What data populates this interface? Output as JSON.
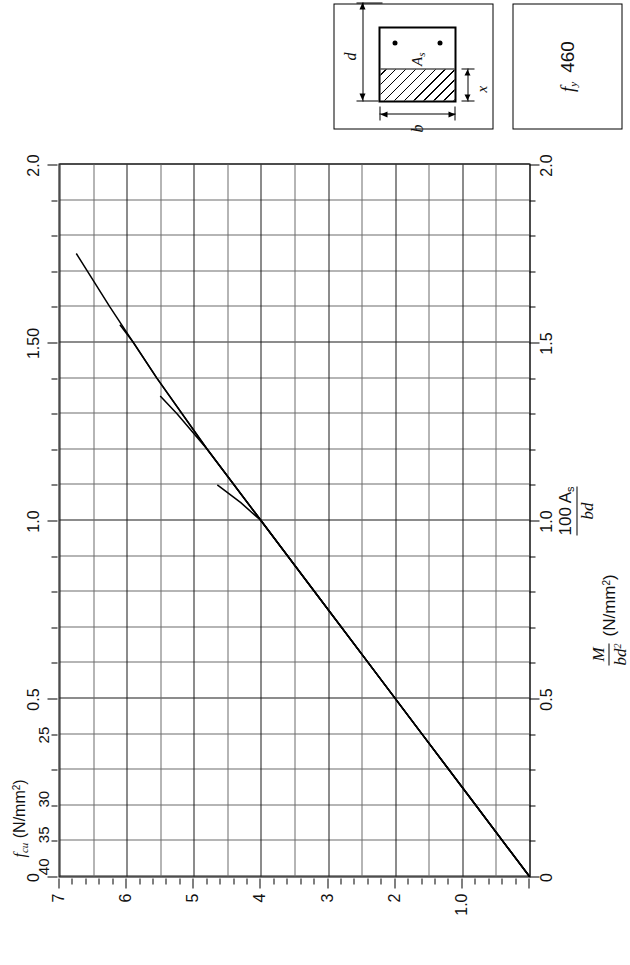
{
  "figure": {
    "fy_box": {
      "symbol": "f",
      "symbol_sub": "y",
      "value": "460"
    },
    "beam_diagram": {
      "label_d": "d",
      "label_b": "b",
      "label_x": "x",
      "label_as": "A",
      "label_as_sub": "s"
    },
    "fcu_legend": {
      "title": "f",
      "title_sub": "cu",
      "title_units": "(N/mm",
      "title_units_sup": "2",
      "title_units_end": ")"
    }
  },
  "chart_data": {
    "type": "line",
    "title": "",
    "xlabel_num": "100 A",
    "xlabel_num_sub": "s",
    "xlabel_den": "bd",
    "ylabel_num": "M",
    "ylabel_den": "bd",
    "ylabel_den_sup": "2",
    "ylabel_units": "(N/mm",
    "ylabel_units_sup": "2",
    "ylabel_units_end": ")",
    "xlim": [
      0,
      2.0
    ],
    "ylim": [
      0,
      7
    ],
    "grid": true,
    "legend_position": "top-left",
    "x_ticks_major": [
      0,
      0.5,
      1.0,
      1.5,
      2.0
    ],
    "x_ticklabels_bottom": [
      "0",
      "0.5",
      "1.0",
      "1.5",
      "2.0"
    ],
    "x_ticklabels_top": [
      "0",
      "0.5",
      "1.0",
      "1.50",
      "2.0"
    ],
    "x_ticks_minor_step": 0.1,
    "y_ticks_major": [
      1,
      2,
      3,
      4,
      5,
      6,
      7
    ],
    "y_ticklabels": [
      "1.0",
      "2",
      "3",
      "4",
      "5",
      "6",
      "7"
    ],
    "y_ticks_minor_step": 0.2,
    "series": [
      {
        "name": "25",
        "label": "25",
        "x": [
          0,
          0.2,
          0.4,
          0.6,
          0.8,
          0.9,
          1.0,
          1.05,
          1.1
        ],
        "values": [
          0,
          0.8,
          1.6,
          2.4,
          3.2,
          3.6,
          4.0,
          4.3,
          4.65
        ]
      },
      {
        "name": "30",
        "label": "30",
        "x": [
          0,
          0.2,
          0.4,
          0.6,
          0.8,
          1.0,
          1.2,
          1.3,
          1.35
        ],
        "values": [
          0,
          0.8,
          1.6,
          2.4,
          3.2,
          4.0,
          4.8,
          5.25,
          5.5
        ]
      },
      {
        "name": "35",
        "label": "35",
        "x": [
          0,
          0.2,
          0.4,
          0.6,
          0.8,
          1.0,
          1.2,
          1.4,
          1.5,
          1.55
        ],
        "values": [
          0,
          0.8,
          1.6,
          2.4,
          3.2,
          4.0,
          4.8,
          5.55,
          5.9,
          6.1
        ]
      },
      {
        "name": "40",
        "label": "40",
        "x": [
          0,
          0.2,
          0.4,
          0.6,
          0.8,
          1.0,
          1.2,
          1.4,
          1.6,
          1.75
        ],
        "values": [
          0,
          0.8,
          1.6,
          2.4,
          3.2,
          4.0,
          4.8,
          5.55,
          6.25,
          6.75
        ]
      }
    ],
    "annotations": [
      {
        "text": "40",
        "x": 0.03,
        "y": 7.1
      },
      {
        "text": "35",
        "x": 0.12,
        "y": 7.1
      },
      {
        "text": "30",
        "x": 0.22,
        "y": 7.1
      },
      {
        "text": "25",
        "x": 0.4,
        "y": 7.1
      }
    ]
  }
}
